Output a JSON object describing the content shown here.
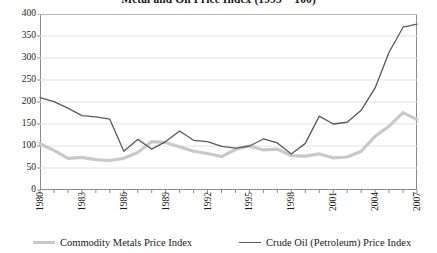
{
  "chart_data": {
    "type": "line",
    "title": "Metal and Oil Price Index (1995 = 100)",
    "xlabel": "",
    "ylabel": "",
    "ylim": [
      0,
      400
    ],
    "ytick_step": 50,
    "yticks": [
      "0",
      "50",
      "100",
      "150",
      "200",
      "250",
      "300",
      "350",
      "400"
    ],
    "grid": "horizontal",
    "legend_position": "bottom",
    "x": [
      1980,
      1981,
      1982,
      1983,
      1984,
      1985,
      1986,
      1987,
      1988,
      1989,
      1990,
      1991,
      1992,
      1993,
      1994,
      1995,
      1996,
      1997,
      1998,
      1999,
      2000,
      2001,
      2002,
      2003,
      2004,
      2005,
      2006,
      2007
    ],
    "xtick_labels": [
      "1980",
      "1983",
      "1986",
      "1989",
      "1992",
      "1995",
      "1998",
      "2001",
      "2004",
      "2007"
    ],
    "xtick_years": [
      1980,
      1983,
      1986,
      1989,
      1992,
      1995,
      1998,
      2001,
      2004,
      2007
    ],
    "xlim": [
      1980,
      2007
    ],
    "series": [
      {
        "name": "Commodity Metals Price Index",
        "color": "#c9c9c9",
        "width": 3.2,
        "values": [
          105,
          90,
          72,
          74,
          69,
          67,
          72,
          85,
          110,
          108,
          98,
          88,
          83,
          76,
          92,
          100,
          91,
          93,
          78,
          77,
          82,
          73,
          75,
          88,
          122,
          145,
          176,
          160
        ]
      },
      {
        "name": "Crude Oil (Petroleum) Price Index",
        "color": "#5a5a5a",
        "width": 1.3,
        "values": [
          210,
          201,
          186,
          169,
          166,
          161,
          88,
          115,
          93,
          110,
          134,
          113,
          110,
          99,
          95,
          100,
          116,
          107,
          82,
          106,
          168,
          150,
          154,
          181,
          232,
          313,
          370,
          377
        ]
      }
    ]
  },
  "legend": {
    "metals_label": "Commodity Metals Price Index",
    "oil_label": "Crude Oil (Petroleum) Price Index"
  }
}
